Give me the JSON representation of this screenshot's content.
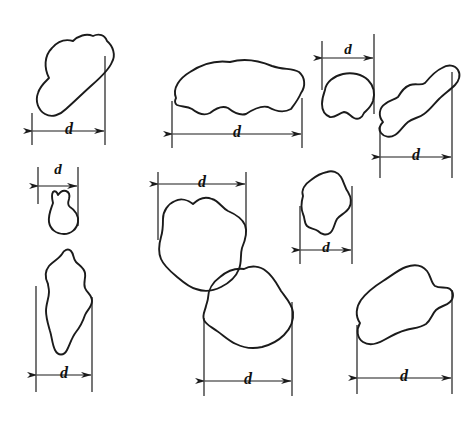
{
  "figure": {
    "background_color": "#ffffff",
    "stroke_color": "#1b1b1b",
    "label_color": "#111111",
    "dimension_symbol": "d",
    "particle_count": 10,
    "dimension_count": 10
  },
  "particles": [
    {
      "id": "particle-1",
      "name": "top-left-oval-blob",
      "label": "d",
      "dimension_placement": "below",
      "dimension_x1": 32,
      "dimension_x2": 105,
      "dimension_y": 131,
      "label_x": 69,
      "label_y": 129
    },
    {
      "id": "particle-2",
      "name": "top-center-wide-wavy-blob",
      "label": "d",
      "dimension_placement": "below",
      "dimension_x1": 172,
      "dimension_x2": 302,
      "dimension_y": 134,
      "label_x": 237,
      "label_y": 132
    },
    {
      "id": "particle-3",
      "name": "top-right-small-cap-blob",
      "label": "d",
      "dimension_placement": "above",
      "dimension_x1": 322,
      "dimension_x2": 374,
      "dimension_y": 58,
      "label_x": 348,
      "label_y": 54
    },
    {
      "id": "particle-4",
      "name": "right-elongated-diagonal-blob",
      "label": "d",
      "dimension_placement": "below",
      "dimension_x1": 380,
      "dimension_x2": 452,
      "dimension_y": 157,
      "label_x": 416,
      "label_y": 155
    },
    {
      "id": "particle-5",
      "name": "left-small-mushroom-blob",
      "label": "d",
      "dimension_placement": "above",
      "dimension_x1": 38,
      "dimension_x2": 78,
      "dimension_y": 186,
      "label_x": 58,
      "label_y": 172
    },
    {
      "id": "particle-6",
      "name": "left-tall-narrow-blob",
      "label": "d",
      "dimension_placement": "below",
      "dimension_x1": 36,
      "dimension_x2": 92,
      "dimension_y": 375,
      "label_x": 64,
      "label_y": 373
    },
    {
      "id": "particle-7",
      "name": "center-rounded-blob",
      "label": "d",
      "dimension_placement": "above",
      "dimension_x1": 158,
      "dimension_x2": 246,
      "dimension_y": 184,
      "label_x": 202,
      "label_y": 180
    },
    {
      "id": "particle-8",
      "name": "middle-right-angular-blob",
      "label": "d",
      "dimension_placement": "below",
      "dimension_x1": 300,
      "dimension_x2": 352,
      "dimension_y": 250,
      "label_x": 326,
      "label_y": 248
    },
    {
      "id": "particle-9",
      "name": "bottom-center-round-blob",
      "label": "d",
      "dimension_placement": "below",
      "dimension_x1": 204,
      "dimension_x2": 292,
      "dimension_y": 381,
      "label_x": 248,
      "label_y": 379
    },
    {
      "id": "particle-10",
      "name": "bottom-right-kidney-blob",
      "label": "d",
      "dimension_placement": "below",
      "dimension_x1": 357,
      "dimension_x2": 452,
      "dimension_y": 378,
      "label_x": 404,
      "label_y": 376
    }
  ]
}
